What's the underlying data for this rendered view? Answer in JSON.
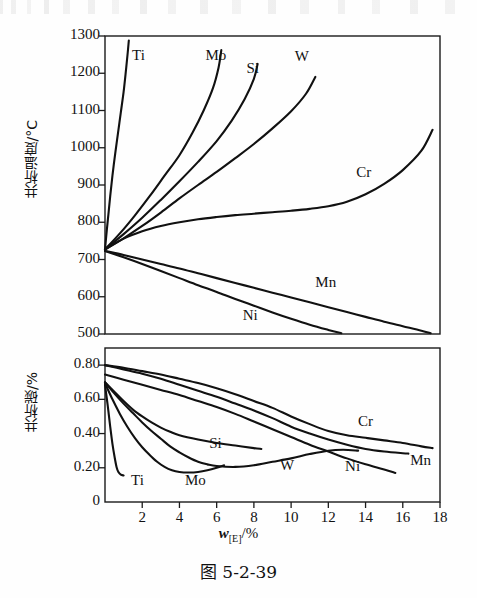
{
  "caption": "图 5-2-39",
  "chart_data": [
    {
      "type": "line",
      "id": "eutectoid-temperature",
      "title": "",
      "xlabel": "w[E]/%",
      "ylabel": "共析温度/°C",
      "xlim": [
        0,
        18
      ],
      "ylim": [
        500,
        1300
      ],
      "xticks": [
        0,
        2,
        4,
        6,
        8,
        10,
        12,
        14,
        16,
        18
      ],
      "xticklabels": [
        "",
        "2",
        "4",
        "6",
        "8",
        "10",
        "12",
        "14",
        "16",
        "18"
      ],
      "yticks": [
        500,
        600,
        700,
        800,
        900,
        1000,
        1100,
        1200,
        1300
      ],
      "yticklabels": [
        "500",
        "600",
        "700",
        "800",
        "900",
        "1000",
        "1100",
        "1200",
        "1300"
      ],
      "grid": false,
      "legend": "inline-labels",
      "series": [
        {
          "name": "Ti",
          "label_pos": [
            1.45,
            1245
          ],
          "points": [
            [
              0.0,
              727
            ],
            [
              0.1,
              780
            ],
            [
              0.18,
              820
            ],
            [
              0.28,
              870
            ],
            [
              0.4,
              925
            ],
            [
              0.55,
              985
            ],
            [
              0.7,
              1040
            ],
            [
              0.85,
              1095
            ],
            [
              1.0,
              1150
            ],
            [
              1.12,
              1205
            ],
            [
              1.22,
              1255
            ],
            [
              1.28,
              1288
            ]
          ]
        },
        {
          "name": "Mo",
          "label_pos": [
            5.4,
            1245
          ],
          "points": [
            [
              0.0,
              727
            ],
            [
              0.8,
              770
            ],
            [
              1.6,
              818
            ],
            [
              2.4,
              870
            ],
            [
              3.2,
              925
            ],
            [
              4.0,
              980
            ],
            [
              4.7,
              1040
            ],
            [
              5.3,
              1100
            ],
            [
              5.8,
              1160
            ],
            [
              6.1,
              1215
            ],
            [
              6.25,
              1262
            ]
          ]
        },
        {
          "name": "Si",
          "label_pos": [
            7.6,
            1210
          ],
          "points": [
            [
              0.0,
              727
            ],
            [
              1.0,
              768
            ],
            [
              2.0,
              812
            ],
            [
              3.0,
              860
            ],
            [
              4.0,
              910
            ],
            [
              5.0,
              962
            ],
            [
              6.0,
              1018
            ],
            [
              6.8,
              1072
            ],
            [
              7.5,
              1130
            ],
            [
              8.0,
              1185
            ],
            [
              8.2,
              1225
            ]
          ]
        },
        {
          "name": "W",
          "label_pos": [
            10.2,
            1240
          ],
          "points": [
            [
              0.0,
              727
            ],
            [
              1.0,
              757
            ],
            [
              2.0,
              790
            ],
            [
              3.0,
              826
            ],
            [
              4.0,
              864
            ],
            [
              5.0,
              900
            ],
            [
              6.0,
              935
            ],
            [
              7.0,
              972
            ],
            [
              8.0,
              1010
            ],
            [
              9.0,
              1052
            ],
            [
              10.0,
              1098
            ],
            [
              10.8,
              1145
            ],
            [
              11.3,
              1190
            ]
          ]
        },
        {
          "name": "Cr",
          "label_pos": [
            13.5,
            930
          ],
          "points": [
            [
              0.0,
              727
            ],
            [
              1.0,
              756
            ],
            [
              2.0,
              776
            ],
            [
              3.0,
              790
            ],
            [
              4.0,
              800
            ],
            [
              5.0,
              808
            ],
            [
              6.0,
              814
            ],
            [
              7.0,
              819
            ],
            [
              8.0,
              823
            ],
            [
              9.0,
              827
            ],
            [
              10.0,
              831
            ],
            [
              11.0,
              836
            ],
            [
              12.0,
              843
            ],
            [
              13.0,
              855
            ],
            [
              14.0,
              875
            ],
            [
              15.0,
              903
            ],
            [
              16.0,
              940
            ],
            [
              17.0,
              992
            ],
            [
              17.6,
              1048
            ]
          ]
        },
        {
          "name": "Mn",
          "label_pos": [
            11.3,
            635
          ],
          "points": [
            [
              0.0,
              723
            ],
            [
              1.0,
              712
            ],
            [
              2.0,
              700
            ],
            [
              3.0,
              688
            ],
            [
              4.0,
              676
            ],
            [
              5.0,
              663
            ],
            [
              6.0,
              650
            ],
            [
              7.0,
              637
            ],
            [
              8.0,
              624
            ],
            [
              9.0,
              611
            ],
            [
              10.0,
              598
            ],
            [
              11.0,
              585
            ],
            [
              12.0,
              572
            ],
            [
              13.0,
              559
            ],
            [
              14.0,
              546
            ],
            [
              15.0,
              533
            ],
            [
              16.0,
              521
            ],
            [
              17.0,
              509
            ],
            [
              17.5,
              502
            ]
          ]
        },
        {
          "name": "Ni",
          "label_pos": [
            7.4,
            545
          ],
          "points": [
            [
              0.0,
              723
            ],
            [
              1.0,
              706
            ],
            [
              2.0,
              688
            ],
            [
              3.0,
              669
            ],
            [
              4.0,
              650
            ],
            [
              5.0,
              631
            ],
            [
              6.0,
              613
            ],
            [
              7.0,
              594
            ],
            [
              8.0,
              576
            ],
            [
              9.0,
              558
            ],
            [
              10.0,
              541
            ],
            [
              11.0,
              525
            ],
            [
              12.0,
              511
            ],
            [
              12.7,
              502
            ]
          ]
        }
      ]
    },
    {
      "type": "line",
      "id": "eutectoid-carbon",
      "title": "",
      "xlabel": "w[E]/%",
      "ylabel": "共析碳/%",
      "xlim": [
        0,
        18
      ],
      "ylim": [
        0,
        0.9
      ],
      "xticks": [
        0,
        2,
        4,
        6,
        8,
        10,
        12,
        14,
        16,
        18
      ],
      "xticklabels": [
        "0",
        "2",
        "4",
        "6",
        "8",
        "10",
        "12",
        "14",
        "16",
        "18"
      ],
      "yticks": [
        0.2,
        0.4,
        0.6,
        0.8
      ],
      "yticklabels": [
        "0.20",
        "0.40",
        "0.60",
        "0.80"
      ],
      "grid": false,
      "legend": "inline-labels",
      "series": [
        {
          "name": "Cr",
          "label_pos": [
            13.6,
            0.46
          ],
          "points": [
            [
              0.0,
              0.8
            ],
            [
              1.0,
              0.785
            ],
            [
              2.0,
              0.765
            ],
            [
              3.0,
              0.745
            ],
            [
              4.0,
              0.72
            ],
            [
              5.0,
              0.695
            ],
            [
              6.0,
              0.665
            ],
            [
              7.0,
              0.63
            ],
            [
              8.0,
              0.59
            ],
            [
              9.0,
              0.55
            ],
            [
              10.0,
              0.5
            ],
            [
              11.0,
              0.455
            ],
            [
              12.0,
              0.415
            ],
            [
              13.0,
              0.39
            ],
            [
              14.0,
              0.375
            ],
            [
              15.0,
              0.36
            ],
            [
              16.0,
              0.345
            ],
            [
              17.0,
              0.325
            ],
            [
              17.6,
              0.315
            ]
          ]
        },
        {
          "name": "Mn",
          "label_pos": [
            16.4,
            0.235
          ],
          "points": [
            [
              0.0,
              0.8
            ],
            [
              1.0,
              0.775
            ],
            [
              2.0,
              0.75
            ],
            [
              3.0,
              0.72
            ],
            [
              4.0,
              0.685
            ],
            [
              5.0,
              0.65
            ],
            [
              6.0,
              0.615
            ],
            [
              7.0,
              0.575
            ],
            [
              8.0,
              0.535
            ],
            [
              9.0,
              0.49
            ],
            [
              10.0,
              0.44
            ],
            [
              11.0,
              0.4
            ],
            [
              12.0,
              0.365
            ],
            [
              13.0,
              0.335
            ],
            [
              14.0,
              0.31
            ],
            [
              15.0,
              0.295
            ],
            [
              16.0,
              0.285
            ],
            [
              16.3,
              0.283
            ]
          ]
        },
        {
          "name": "Ni",
          "label_pos": [
            12.9,
            0.2
          ],
          "points": [
            [
              0.0,
              0.745
            ],
            [
              1.0,
              0.715
            ],
            [
              2.0,
              0.685
            ],
            [
              3.0,
              0.655
            ],
            [
              4.0,
              0.625
            ],
            [
              5.0,
              0.59
            ],
            [
              6.0,
              0.555
            ],
            [
              7.0,
              0.515
            ],
            [
              8.0,
              0.47
            ],
            [
              9.0,
              0.425
            ],
            [
              10.0,
              0.38
            ],
            [
              11.0,
              0.335
            ],
            [
              12.0,
              0.295
            ],
            [
              13.0,
              0.255
            ],
            [
              14.0,
              0.22
            ],
            [
              15.0,
              0.19
            ],
            [
              15.6,
              0.17
            ]
          ]
        },
        {
          "name": "W",
          "label_pos": [
            9.4,
            0.205
          ],
          "points": [
            [
              0.0,
              0.7
            ],
            [
              0.5,
              0.635
            ],
            [
              1.0,
              0.575
            ],
            [
              1.5,
              0.52
            ],
            [
              2.0,
              0.465
            ],
            [
              2.5,
              0.415
            ],
            [
              3.0,
              0.37
            ],
            [
              3.5,
              0.325
            ],
            [
              4.0,
              0.29
            ],
            [
              4.5,
              0.26
            ],
            [
              5.0,
              0.235
            ],
            [
              5.5,
              0.22
            ],
            [
              6.0,
              0.21
            ],
            [
              7.0,
              0.205
            ],
            [
              8.0,
              0.215
            ],
            [
              9.0,
              0.235
            ],
            [
              10.0,
              0.255
            ],
            [
              11.0,
              0.28
            ],
            [
              12.0,
              0.3
            ],
            [
              12.8,
              0.305
            ],
            [
              13.6,
              0.3
            ]
          ]
        },
        {
          "name": "Si",
          "label_pos": [
            5.6,
            0.335
          ],
          "points": [
            [
              0.0,
              0.7
            ],
            [
              0.5,
              0.645
            ],
            [
              1.0,
              0.59
            ],
            [
              1.5,
              0.54
            ],
            [
              2.0,
              0.5
            ],
            [
              2.5,
              0.465
            ],
            [
              3.0,
              0.435
            ],
            [
              3.5,
              0.41
            ],
            [
              4.0,
              0.39
            ],
            [
              5.0,
              0.365
            ],
            [
              6.0,
              0.345
            ],
            [
              7.0,
              0.33
            ],
            [
              8.0,
              0.315
            ],
            [
              8.4,
              0.31
            ]
          ]
        },
        {
          "name": "Mo",
          "label_pos": [
            4.3,
            0.115
          ],
          "points": [
            [
              0.0,
              0.695
            ],
            [
              0.4,
              0.6
            ],
            [
              0.8,
              0.515
            ],
            [
              1.2,
              0.44
            ],
            [
              1.6,
              0.375
            ],
            [
              2.0,
              0.32
            ],
            [
              2.4,
              0.275
            ],
            [
              2.8,
              0.235
            ],
            [
              3.2,
              0.205
            ],
            [
              3.6,
              0.185
            ],
            [
              4.0,
              0.175
            ],
            [
              4.5,
              0.172
            ],
            [
              5.0,
              0.175
            ],
            [
              5.5,
              0.185
            ],
            [
              6.0,
              0.2
            ],
            [
              6.4,
              0.215
            ]
          ]
        },
        {
          "name": "Ti",
          "label_pos": [
            1.4,
            0.115
          ],
          "points": [
            [
              0.0,
              0.685
            ],
            [
              0.15,
              0.56
            ],
            [
              0.28,
              0.44
            ],
            [
              0.4,
              0.34
            ],
            [
              0.52,
              0.26
            ],
            [
              0.62,
              0.205
            ],
            [
              0.72,
              0.175
            ],
            [
              0.85,
              0.16
            ],
            [
              1.0,
              0.155
            ]
          ]
        }
      ]
    }
  ]
}
